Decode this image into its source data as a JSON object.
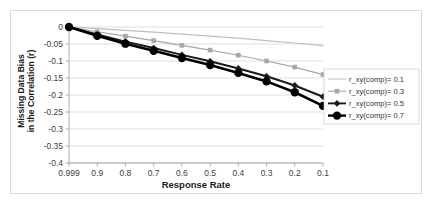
{
  "chart_data": {
    "type": "line",
    "title": "",
    "xlabel": "Response Rate",
    "ylabel_line1": "Missing Data Bias",
    "ylabel_line2": "in the Correlation (r)",
    "categories": [
      "0.999",
      "0.9",
      "0.8",
      "0.7",
      "0.6",
      "0.5",
      "0.4",
      "0.3",
      "0.2",
      "0.1"
    ],
    "ylim": [
      -0.4,
      0
    ],
    "ytick_labels": [
      "0",
      "-0.05",
      "-0.1",
      "-0.15",
      "-0.2",
      "-0.25",
      "-0.3",
      "-0.35",
      "-0.4"
    ],
    "ytick_values": [
      0,
      -0.05,
      -0.1,
      -0.15,
      -0.2,
      -0.25,
      -0.3,
      -0.35,
      -0.4
    ],
    "grid": true,
    "legend_position": "right",
    "series": [
      {
        "name": "r_xy(comp)= 0.1",
        "color": "#bfbfbf",
        "marker": "none",
        "values": [
          0,
          -0.005,
          -0.01,
          -0.015,
          -0.021,
          -0.027,
          -0.033,
          -0.04,
          -0.047,
          -0.055
        ]
      },
      {
        "name": "r_xy(comp)= 0.3",
        "color": "#a6a6a6",
        "marker": "square",
        "values": [
          0,
          -0.014,
          -0.027,
          -0.04,
          -0.054,
          -0.068,
          -0.083,
          -0.1,
          -0.118,
          -0.14
        ]
      },
      {
        "name": "r_xy(comp)= 0.5",
        "color": "#1a1a1a",
        "marker": "diamond",
        "values": [
          0,
          -0.022,
          -0.043,
          -0.062,
          -0.082,
          -0.101,
          -0.122,
          -0.145,
          -0.172,
          -0.205
        ]
      },
      {
        "name": "r_xy(comp)= 0.7",
        "color": "#000000",
        "marker": "circle",
        "values": [
          0,
          -0.026,
          -0.049,
          -0.07,
          -0.091,
          -0.112,
          -0.135,
          -0.16,
          -0.192,
          -0.232
        ]
      }
    ]
  }
}
